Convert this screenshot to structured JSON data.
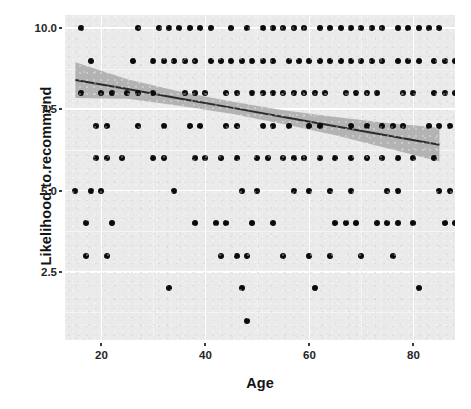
{
  "chart_data": {
    "type": "scatter",
    "title": "",
    "xlabel": "Age",
    "ylabel": "Likelihood.to.recommend",
    "xlim": [
      13,
      88
    ],
    "ylim": [
      0.4,
      10.4
    ],
    "xticks": [
      20,
      40,
      60,
      80
    ],
    "yticks": [
      2.5,
      5.0,
      7.5,
      10.0
    ],
    "xtick_labels": [
      "20",
      "40",
      "60",
      "80"
    ],
    "ytick_labels": [
      "2.5",
      "5.0",
      "7.5",
      "10.0"
    ],
    "grid": true,
    "grid_major_color": "#ffffff",
    "grid_minor_color": "#f4f4f4",
    "panel_background": "#eaeaea",
    "point_color": "#0b0b0b",
    "point_size": 6,
    "legend": "none",
    "smooth": {
      "method": "lm",
      "line_color": "#2b2b2b",
      "ribbon_color": "#a9a9a9",
      "intercept_at_x_min": 8.42,
      "slope_per_year": -0.0286,
      "fit_points": [
        {
          "x": 15,
          "y": 8.4,
          "lo": 8.95,
          "hi": 7.85
        },
        {
          "x": 25,
          "y": 8.12,
          "lo": 8.42,
          "hi": 7.82
        },
        {
          "x": 35,
          "y": 7.83,
          "lo": 8.05,
          "hi": 7.61
        },
        {
          "x": 45,
          "y": 7.55,
          "lo": 7.74,
          "hi": 7.36
        },
        {
          "x": 55,
          "y": 7.26,
          "lo": 7.47,
          "hi": 7.05
        },
        {
          "x": 65,
          "y": 6.98,
          "lo": 7.26,
          "hi": 6.7
        },
        {
          "x": 75,
          "y": 6.69,
          "lo": 7.08,
          "hi": 6.3
        },
        {
          "x": 85,
          "y": 6.41,
          "lo": 6.93,
          "hi": 5.89
        }
      ]
    },
    "series": [
      {
        "name": "respondents",
        "points": [
          {
            "x": 16,
            "y": 10
          },
          {
            "x": 27,
            "y": 10
          },
          {
            "x": 31,
            "y": 10
          },
          {
            "x": 33,
            "y": 10
          },
          {
            "x": 35,
            "y": 10
          },
          {
            "x": 37,
            "y": 10
          },
          {
            "x": 39,
            "y": 10
          },
          {
            "x": 41,
            "y": 10
          },
          {
            "x": 45,
            "y": 10
          },
          {
            "x": 48,
            "y": 10
          },
          {
            "x": 51,
            "y": 10
          },
          {
            "x": 53,
            "y": 10
          },
          {
            "x": 55,
            "y": 10
          },
          {
            "x": 57,
            "y": 10
          },
          {
            "x": 59,
            "y": 10
          },
          {
            "x": 62,
            "y": 10
          },
          {
            "x": 64,
            "y": 10
          },
          {
            "x": 66,
            "y": 10
          },
          {
            "x": 68,
            "y": 10
          },
          {
            "x": 70,
            "y": 10
          },
          {
            "x": 72,
            "y": 10
          },
          {
            "x": 74,
            "y": 10
          },
          {
            "x": 77,
            "y": 10
          },
          {
            "x": 79,
            "y": 10
          },
          {
            "x": 81,
            "y": 10
          },
          {
            "x": 83,
            "y": 10
          },
          {
            "x": 85,
            "y": 10
          },
          {
            "x": 91,
            "y": 10
          },
          {
            "x": 96,
            "y": 10
          },
          {
            "x": 98,
            "y": 10
          },
          {
            "x": 18,
            "y": 9
          },
          {
            "x": 26,
            "y": 9
          },
          {
            "x": 30,
            "y": 9
          },
          {
            "x": 32,
            "y": 9
          },
          {
            "x": 34,
            "y": 9
          },
          {
            "x": 36,
            "y": 9
          },
          {
            "x": 38,
            "y": 9
          },
          {
            "x": 41,
            "y": 9
          },
          {
            "x": 43,
            "y": 9
          },
          {
            "x": 45,
            "y": 9
          },
          {
            "x": 47,
            "y": 9
          },
          {
            "x": 49,
            "y": 9
          },
          {
            "x": 51,
            "y": 9
          },
          {
            "x": 53,
            "y": 9
          },
          {
            "x": 56,
            "y": 9
          },
          {
            "x": 58,
            "y": 9
          },
          {
            "x": 60,
            "y": 9
          },
          {
            "x": 62,
            "y": 9
          },
          {
            "x": 64,
            "y": 9
          },
          {
            "x": 66,
            "y": 9
          },
          {
            "x": 68,
            "y": 9
          },
          {
            "x": 70,
            "y": 9
          },
          {
            "x": 72,
            "y": 9
          },
          {
            "x": 74,
            "y": 9
          },
          {
            "x": 77,
            "y": 9
          },
          {
            "x": 79,
            "y": 9
          },
          {
            "x": 81,
            "y": 9
          },
          {
            "x": 84,
            "y": 9
          },
          {
            "x": 86,
            "y": 9
          },
          {
            "x": 88,
            "y": 9
          },
          {
            "x": 90,
            "y": 9
          },
          {
            "x": 93,
            "y": 9
          },
          {
            "x": 99,
            "y": 9
          },
          {
            "x": 106,
            "y": 9
          },
          {
            "x": 16,
            "y": 8
          },
          {
            "x": 20,
            "y": 8
          },
          {
            "x": 22,
            "y": 8
          },
          {
            "x": 25,
            "y": 8
          },
          {
            "x": 27,
            "y": 8
          },
          {
            "x": 30,
            "y": 8
          },
          {
            "x": 36,
            "y": 8
          },
          {
            "x": 38,
            "y": 8
          },
          {
            "x": 40,
            "y": 8
          },
          {
            "x": 44,
            "y": 8
          },
          {
            "x": 46,
            "y": 8
          },
          {
            "x": 49,
            "y": 8
          },
          {
            "x": 51,
            "y": 8
          },
          {
            "x": 53,
            "y": 8
          },
          {
            "x": 55,
            "y": 8
          },
          {
            "x": 57,
            "y": 8
          },
          {
            "x": 59,
            "y": 8
          },
          {
            "x": 61,
            "y": 8
          },
          {
            "x": 63,
            "y": 8
          },
          {
            "x": 67,
            "y": 8
          },
          {
            "x": 69,
            "y": 8
          },
          {
            "x": 71,
            "y": 8
          },
          {
            "x": 73,
            "y": 8
          },
          {
            "x": 78,
            "y": 8
          },
          {
            "x": 80,
            "y": 8
          },
          {
            "x": 84,
            "y": 8
          },
          {
            "x": 86,
            "y": 8
          },
          {
            "x": 88,
            "y": 8
          },
          {
            "x": 91,
            "y": 8
          },
          {
            "x": 97,
            "y": 8
          },
          {
            "x": 103,
            "y": 8
          },
          {
            "x": 19,
            "y": 7
          },
          {
            "x": 21,
            "y": 7
          },
          {
            "x": 27,
            "y": 7
          },
          {
            "x": 32,
            "y": 7
          },
          {
            "x": 37,
            "y": 7
          },
          {
            "x": 39,
            "y": 7
          },
          {
            "x": 44,
            "y": 7
          },
          {
            "x": 46,
            "y": 7
          },
          {
            "x": 51,
            "y": 7
          },
          {
            "x": 53,
            "y": 7
          },
          {
            "x": 56,
            "y": 7
          },
          {
            "x": 60,
            "y": 7
          },
          {
            "x": 62,
            "y": 7
          },
          {
            "x": 68,
            "y": 7
          },
          {
            "x": 71,
            "y": 7
          },
          {
            "x": 74,
            "y": 7
          },
          {
            "x": 76,
            "y": 7
          },
          {
            "x": 78,
            "y": 7
          },
          {
            "x": 83,
            "y": 7
          },
          {
            "x": 85,
            "y": 7
          },
          {
            "x": 87,
            "y": 7
          },
          {
            "x": 92,
            "y": 7
          },
          {
            "x": 96,
            "y": 7
          },
          {
            "x": 100,
            "y": 7
          },
          {
            "x": 104,
            "y": 7
          },
          {
            "x": 110,
            "y": 7
          },
          {
            "x": 19,
            "y": 6
          },
          {
            "x": 21,
            "y": 6
          },
          {
            "x": 24,
            "y": 6
          },
          {
            "x": 30,
            "y": 6
          },
          {
            "x": 32,
            "y": 6
          },
          {
            "x": 38,
            "y": 6
          },
          {
            "x": 40,
            "y": 6
          },
          {
            "x": 43,
            "y": 6
          },
          {
            "x": 46,
            "y": 6
          },
          {
            "x": 50,
            "y": 6
          },
          {
            "x": 52,
            "y": 6
          },
          {
            "x": 55,
            "y": 6
          },
          {
            "x": 57,
            "y": 6
          },
          {
            "x": 59,
            "y": 6
          },
          {
            "x": 62,
            "y": 6
          },
          {
            "x": 65,
            "y": 6
          },
          {
            "x": 68,
            "y": 6
          },
          {
            "x": 71,
            "y": 6
          },
          {
            "x": 74,
            "y": 6
          },
          {
            "x": 77,
            "y": 6
          },
          {
            "x": 80,
            "y": 6
          },
          {
            "x": 84,
            "y": 6
          },
          {
            "x": 91,
            "y": 6
          },
          {
            "x": 15,
            "y": 5
          },
          {
            "x": 18,
            "y": 5
          },
          {
            "x": 20,
            "y": 5
          },
          {
            "x": 34,
            "y": 5
          },
          {
            "x": 47,
            "y": 5
          },
          {
            "x": 50,
            "y": 5
          },
          {
            "x": 57,
            "y": 5
          },
          {
            "x": 60,
            "y": 5
          },
          {
            "x": 64,
            "y": 5
          },
          {
            "x": 68,
            "y": 5
          },
          {
            "x": 75,
            "y": 5
          },
          {
            "x": 77,
            "y": 5
          },
          {
            "x": 85,
            "y": 5
          },
          {
            "x": 87,
            "y": 5
          },
          {
            "x": 95,
            "y": 5
          },
          {
            "x": 17,
            "y": 4
          },
          {
            "x": 22,
            "y": 4
          },
          {
            "x": 38,
            "y": 4
          },
          {
            "x": 42,
            "y": 4
          },
          {
            "x": 44,
            "y": 4
          },
          {
            "x": 49,
            "y": 4
          },
          {
            "x": 53,
            "y": 4
          },
          {
            "x": 65,
            "y": 4
          },
          {
            "x": 67,
            "y": 4
          },
          {
            "x": 69,
            "y": 4
          },
          {
            "x": 73,
            "y": 4
          },
          {
            "x": 75,
            "y": 4
          },
          {
            "x": 77,
            "y": 4
          },
          {
            "x": 80,
            "y": 4
          },
          {
            "x": 86,
            "y": 4
          },
          {
            "x": 88,
            "y": 4
          },
          {
            "x": 92,
            "y": 4
          },
          {
            "x": 96,
            "y": 4
          },
          {
            "x": 17,
            "y": 3
          },
          {
            "x": 21,
            "y": 3
          },
          {
            "x": 43,
            "y": 3
          },
          {
            "x": 46,
            "y": 3
          },
          {
            "x": 48,
            "y": 3
          },
          {
            "x": 55,
            "y": 3
          },
          {
            "x": 60,
            "y": 3
          },
          {
            "x": 64,
            "y": 3
          },
          {
            "x": 70,
            "y": 3
          },
          {
            "x": 76,
            "y": 3
          },
          {
            "x": 90,
            "y": 3
          },
          {
            "x": 33,
            "y": 2
          },
          {
            "x": 47,
            "y": 2
          },
          {
            "x": 61,
            "y": 2
          },
          {
            "x": 81,
            "y": 2
          },
          {
            "x": 48,
            "y": 1
          }
        ]
      }
    ]
  },
  "axis": {
    "y_title": "Likelihood.to.recommend",
    "x_title": "Age"
  }
}
